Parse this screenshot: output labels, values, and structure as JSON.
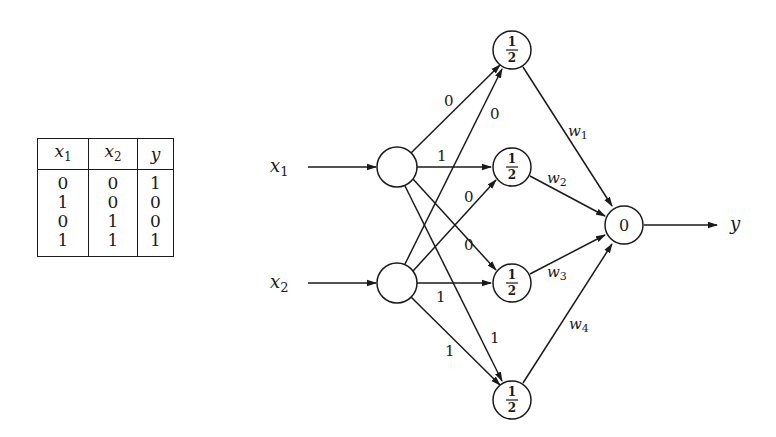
{
  "truth_table": {
    "headers": [
      {
        "var": "x",
        "sub": "1"
      },
      {
        "var": "x",
        "sub": "2"
      },
      {
        "var": "y",
        "sub": ""
      }
    ],
    "rows": [
      [
        "0",
        "0",
        "1"
      ],
      [
        "1",
        "0",
        "0"
      ],
      [
        "0",
        "1",
        "0"
      ],
      [
        "1",
        "1",
        "1"
      ]
    ]
  },
  "network": {
    "inputs": [
      {
        "var": "x",
        "sub": "1"
      },
      {
        "var": "x",
        "sub": "2"
      }
    ],
    "hidden_thresholds": {
      "h1": {
        "num": "1",
        "den": "2"
      },
      "h2": {
        "num": "1",
        "den": "2"
      },
      "h3": {
        "num": "1",
        "den": "2"
      },
      "h4": {
        "num": "1",
        "den": "2"
      }
    },
    "output_threshold": "0",
    "output_label": "y",
    "edge_weights": {
      "x1_h1": "0",
      "x1_h2": "1",
      "x1_h3": "0",
      "x1_h4": "1",
      "x2_h1": "0",
      "x2_h2": "0",
      "x2_h3": "1",
      "x2_h4": "1"
    },
    "output_weights": [
      {
        "var": "w",
        "sub": "1"
      },
      {
        "var": "w",
        "sub": "2"
      },
      {
        "var": "w",
        "sub": "3"
      },
      {
        "var": "w",
        "sub": "4"
      }
    ]
  }
}
